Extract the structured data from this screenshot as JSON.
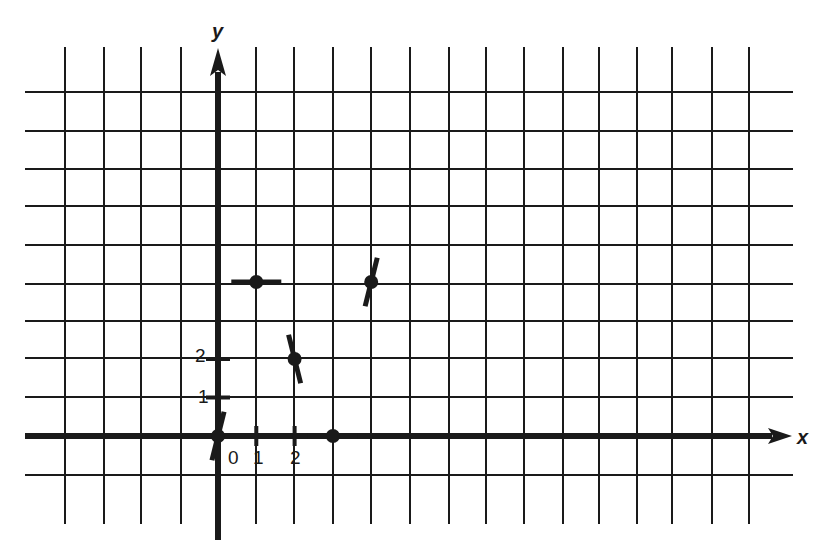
{
  "chart_data": {
    "type": "scatter",
    "title": "",
    "subtitle": "Points with short tangent (slope) segments on a coordinate grid",
    "xlabel": "x",
    "ylabel": "y",
    "x_tick_labels": [
      "0",
      "1",
      "2"
    ],
    "y_tick_labels": [
      "1",
      "2"
    ],
    "xlim": [
      -4,
      14
    ],
    "ylim": [
      -2,
      9
    ],
    "grid": true,
    "legend": null,
    "points": [
      {
        "x": 0,
        "y": 0,
        "segment_slope": "steep positive"
      },
      {
        "x": 1,
        "y": 4,
        "segment_slope": 0
      },
      {
        "x": 2,
        "y": 2,
        "segment_slope": "steep negative"
      },
      {
        "x": 3,
        "y": 0,
        "segment_slope": 0
      },
      {
        "x": 4,
        "y": 4,
        "segment_slope": "steep positive"
      }
    ],
    "colors": {
      "ink": "#1a1a1a",
      "background": "#ffffff"
    }
  },
  "labels": {
    "x_axis": "x",
    "y_axis": "y",
    "origin": "0",
    "x1": "1",
    "x2": "2",
    "y1": "1",
    "y2": "2"
  }
}
